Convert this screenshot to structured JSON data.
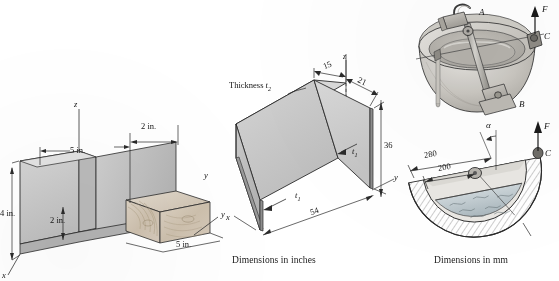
{
  "page": {
    "width": 559,
    "height": 281,
    "background": "#ffffff"
  },
  "figures": [
    {
      "id": "wood-channel-beam",
      "name": "Wooden channel section beam with coordinate axes",
      "axes": {
        "x": "x",
        "y": "y",
        "z": "z"
      },
      "dimensions": [
        {
          "label": "5 in.",
          "position": "top-left-span"
        },
        {
          "label": "2 in.",
          "position": "top-right-span"
        },
        {
          "label": "4 in.",
          "position": "left-vertical"
        },
        {
          "label": "2 in.",
          "position": "inner-vertical"
        },
        {
          "label": "5 in.",
          "position": "depth-diagonal"
        }
      ],
      "caption": ""
    },
    {
      "id": "thin-wall-channel",
      "name": "Thin walled channel cross section",
      "axes": {
        "x": "x",
        "y": "y",
        "z": "z"
      },
      "annotations": [
        {
          "label": "Thickness",
          "symbol": "t",
          "subscript": "2"
        },
        {
          "label": "",
          "symbol": "t",
          "subscript": "1"
        },
        {
          "label": "",
          "symbol": "t",
          "subscript": "1"
        }
      ],
      "dimensions": [
        {
          "label": "15",
          "position": "top-left"
        },
        {
          "label": "21",
          "position": "top-right"
        },
        {
          "label": "36",
          "position": "right-vertical"
        },
        {
          "label": "54",
          "position": "bottom-diagonal"
        }
      ],
      "caption": "Dimensions in inches"
    },
    {
      "id": "bucket-mechanism",
      "name": "Hemispherical bucket with trunnion lifting mechanism",
      "labels": [
        {
          "text": "A",
          "role": "pivot-upper"
        },
        {
          "text": "B",
          "role": "pivot-lower"
        },
        {
          "text": "C",
          "role": "lift-point"
        },
        {
          "text": "F",
          "role": "applied-force"
        }
      ],
      "caption": ""
    },
    {
      "id": "bucket-section",
      "name": "Bucket cross section with liquid fill",
      "labels": [
        {
          "text": "F",
          "role": "applied-force"
        },
        {
          "text": "C",
          "role": "lift-point"
        },
        {
          "text": "α",
          "role": "angle"
        }
      ],
      "dimensions": [
        {
          "label": "280",
          "position": "outer-radius"
        },
        {
          "label": "200",
          "position": "inner-radius"
        }
      ],
      "caption": "Dimensions in mm"
    }
  ],
  "colors": {
    "line": "#1a1a1a",
    "face_light": "#dcdcdc",
    "face_mid": "#c4c4c4",
    "face_dark": "#a9a9a9",
    "wood": "#d8cfc0",
    "wood_dark": "#c0b39f",
    "liquid": "#b9c6cc",
    "paper": "#ffffff"
  }
}
